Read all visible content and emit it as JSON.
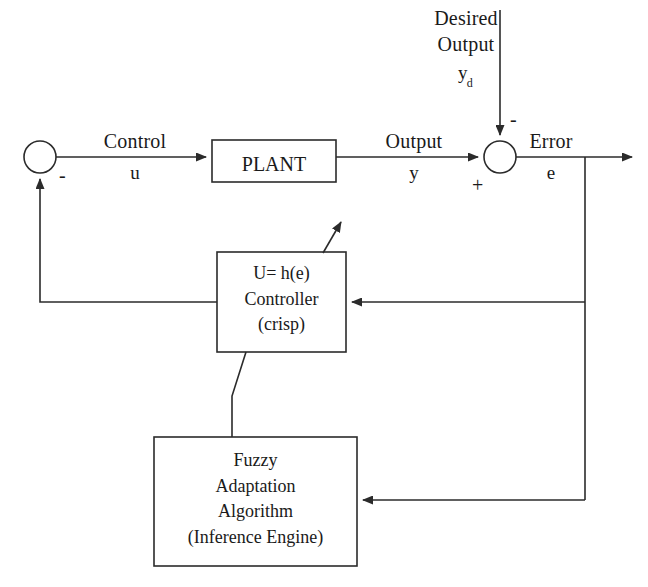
{
  "diagram": {
    "type": "control-block-diagram",
    "line_color": "#2b2b2b",
    "background": "#ffffff"
  },
  "blocks": {
    "plant": {
      "label": "PLANT"
    },
    "controller": {
      "line1": "U= h(e)",
      "line2": "Controller",
      "line3": "(crisp)"
    },
    "fuzzy": {
      "line1": "Fuzzy",
      "line2": "Adaptation",
      "line3": "Algorithm",
      "line4": "(Inference Engine)"
    }
  },
  "signals": {
    "control_name": "Control",
    "control_symbol": "u",
    "output_name": "Output",
    "output_symbol": "y",
    "error_name": "Error",
    "error_symbol": "e",
    "desired_line1": "Desired",
    "desired_line2": "Output",
    "desired_symbol": "y",
    "desired_subscript": "d"
  },
  "junction_signs": {
    "left_minus": "-",
    "right_minus": "-",
    "right_plus": "+"
  }
}
